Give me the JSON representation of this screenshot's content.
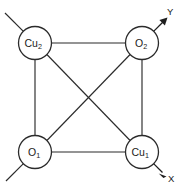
{
  "figure": {
    "type": "molecular-structure-diagram",
    "background_color": "#ffffff",
    "line_color": "#2b2b2b",
    "text_color": "#1a1a1a",
    "width": 181,
    "height": 188
  },
  "atoms": [
    {
      "id": "cu2",
      "element": "Cu",
      "subscript": "2",
      "label": "Cu",
      "position": "top-left",
      "cx": 35,
      "cy": 43,
      "r": 16.5
    },
    {
      "id": "o2",
      "element": "O",
      "subscript": "2",
      "label": "O",
      "position": "top-right",
      "cx": 142,
      "cy": 43,
      "r": 16.5
    },
    {
      "id": "o1",
      "element": "O",
      "subscript": "1",
      "label": "O",
      "position": "bottom-left",
      "cx": 35,
      "cy": 152,
      "r": 16.5
    },
    {
      "id": "cu1",
      "element": "Cu",
      "subscript": "1",
      "label": "Cu",
      "position": "bottom-right",
      "cx": 142,
      "cy": 152,
      "r": 16.5
    }
  ],
  "bonds": [
    {
      "id": "bond-cu2-o2",
      "from": "cu2",
      "to": "o2",
      "kind": "edge-top"
    },
    {
      "id": "bond-o1-cu1",
      "from": "o1",
      "to": "cu1",
      "kind": "edge-bottom"
    },
    {
      "id": "bond-cu2-o1",
      "from": "cu2",
      "to": "o1",
      "kind": "edge-left"
    },
    {
      "id": "bond-o2-cu1",
      "from": "o2",
      "to": "cu1",
      "kind": "edge-right"
    },
    {
      "id": "bond-cu2-cu1",
      "from": "cu2",
      "to": "cu1",
      "kind": "diagonal"
    },
    {
      "id": "bond-o2-o1",
      "from": "o2",
      "to": "o1",
      "kind": "diagonal"
    }
  ],
  "stubs": [
    {
      "id": "stub-cu2-upper-left",
      "at": "cu2",
      "direction": "up-left"
    },
    {
      "id": "stub-o1-lower-left",
      "at": "o1",
      "direction": "down-left"
    }
  ],
  "axes": [
    {
      "id": "axis-y",
      "label": "Y",
      "origin_atom": "o2",
      "direction": "up-right",
      "label_x": 167,
      "label_y": 15
    },
    {
      "id": "axis-x",
      "label": "X",
      "origin_atom": "cu1",
      "direction": "down-right",
      "label_x": 168,
      "label_y": 182
    }
  ]
}
